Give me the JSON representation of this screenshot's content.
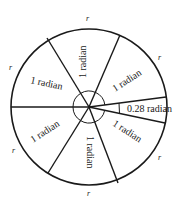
{
  "diagram": {
    "center": {
      "x": 89,
      "y": 107
    },
    "radius": 78,
    "stroke_color": "#1a1a1a",
    "arc_label": "r",
    "sector_labels": [
      {
        "id": "sector-1",
        "text": "1 radian"
      },
      {
        "id": "sector-2",
        "text": "1 radian"
      },
      {
        "id": "sector-3",
        "text": "1 radian"
      },
      {
        "id": "sector-4",
        "text": "1 radian"
      },
      {
        "id": "sector-5",
        "text": "1 radian"
      },
      {
        "id": "sector-6",
        "text": "1 radian"
      }
    ],
    "remainder_label": "0.28 radian",
    "r_labels": [
      "r",
      "r",
      "r",
      "r",
      "r",
      "r"
    ]
  }
}
